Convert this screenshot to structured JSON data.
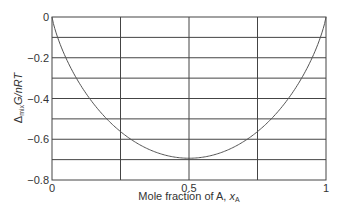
{
  "chart_data": {
    "type": "line",
    "title": "",
    "xlabel": "Mole fraction of A, x_A",
    "xlabel_parts": {
      "main": "Mole fraction of A, ",
      "var": "x",
      "sub": "A"
    },
    "ylabel": "Δ_mix G/nRT",
    "ylabel_parts": {
      "delta": "Δ",
      "sub": "mix",
      "rest": "G/nRT"
    },
    "xlim": [
      0,
      1
    ],
    "ylim": [
      -0.8,
      0
    ],
    "x_ticks": [
      "0",
      "0.5",
      "1"
    ],
    "y_ticks": [
      "0",
      "−0.2",
      "−0.4",
      "−0.6",
      "−0.8"
    ],
    "grid": {
      "x_step": 0.25,
      "y_step": 0.1
    },
    "legend": null,
    "series": [
      {
        "name": "Δ_mix G/nRT = x_A ln x_A + x_B ln x_B",
        "x": [
          0,
          0.01,
          0.05,
          0.1,
          0.2,
          0.3,
          0.4,
          0.5,
          0.6,
          0.7,
          0.8,
          0.9,
          0.95,
          0.99,
          1
        ],
        "y": [
          0,
          -0.056,
          -0.199,
          -0.325,
          -0.5,
          -0.611,
          -0.673,
          -0.693,
          -0.673,
          -0.611,
          -0.5,
          -0.325,
          -0.199,
          -0.056,
          0
        ]
      }
    ],
    "colors": {
      "line": "#555555",
      "grid": "#444444",
      "axis": "#444444"
    }
  }
}
